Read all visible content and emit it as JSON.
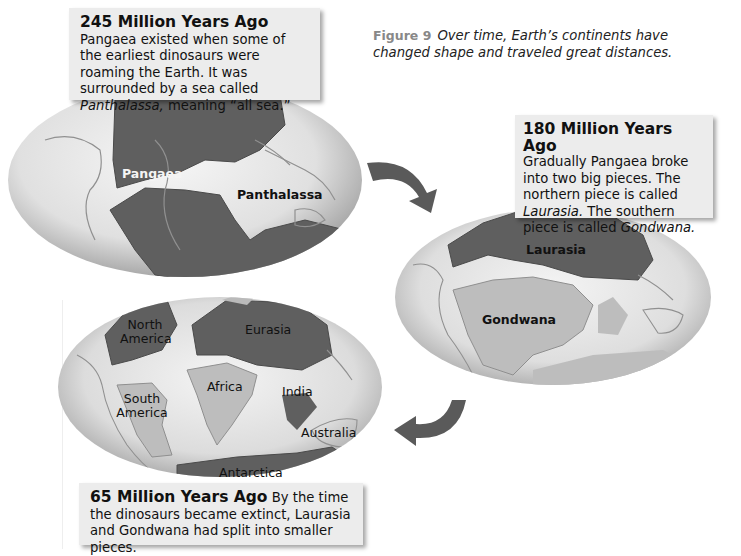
{
  "figure": {
    "number_label": "Figure 9",
    "caption_line1": "Over time, Earth’s continents have",
    "caption_line2": "changed shape and traveled great distances."
  },
  "panels": [
    {
      "id": "245mya",
      "title": "245 Million Years Ago",
      "text_parts": [
        {
          "text": " Pangaea existed when some of the earliest dinosaurs were roaming the Earth. It was surrounded by a sea called ",
          "italic": false
        },
        {
          "text": "Panthalassa,",
          "italic": true
        },
        {
          "text": " meaning “all sea.”",
          "italic": false
        }
      ],
      "map_labels": [
        "Pangaea",
        "Panthalassa"
      ]
    },
    {
      "id": "180mya",
      "title": "180 Million Years Ago",
      "text_parts": [
        {
          "text": "Gradually Pangaea broke into two big pieces. The northern piece is called ",
          "italic": false
        },
        {
          "text": "Laurasia.",
          "italic": true
        },
        {
          "text": " The southern piece is called ",
          "italic": false
        },
        {
          "text": "Gondwana.",
          "italic": true
        }
      ],
      "map_labels": [
        "Laurasia",
        "Gondwana"
      ]
    },
    {
      "id": "65mya",
      "title": "65 Million Years Ago",
      "text_parts": [
        {
          "text": " By the time the dinosaurs became extinct, Laurasia and Gondwana had split into smaller pieces.",
          "italic": false
        }
      ],
      "map_labels": [
        "North America",
        "Eurasia",
        "Africa",
        "South America",
        "India",
        "Australia",
        "Antarctica"
      ]
    }
  ],
  "icons": {
    "arrow1": "curved-arrow-down-right",
    "arrow2": "curved-arrow-down-left"
  },
  "colors": {
    "ocean_light": "#e8e8e8",
    "ocean_dark": "#a9a9a9",
    "land_dark": "#5f5f5f",
    "land_light": "#bdbdbd",
    "callout_bg": "#ececec",
    "arrow": "#5a5a5a"
  }
}
